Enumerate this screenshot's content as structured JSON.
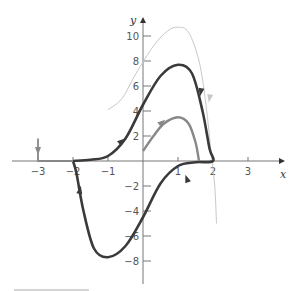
{
  "chart_data": {
    "type": "line",
    "title": "",
    "xlabel": "x",
    "ylabel": "y",
    "xlim": [
      -3.5,
      3.8
    ],
    "ylim": [
      -9.5,
      11
    ],
    "grid": false,
    "x_ticks": [
      -3,
      -2,
      -1,
      1,
      2,
      3
    ],
    "x_tick_labels": [
      "-3",
      "-2",
      "-1",
      "1",
      "2",
      "3"
    ],
    "y_ticks": [
      10,
      8,
      6,
      4,
      2,
      -2,
      -4,
      -6,
      -8
    ],
    "y_tick_labels": [
      "10",
      "8",
      "6",
      "4",
      "2",
      "-2",
      "-4",
      "-6",
      "-8"
    ],
    "series": [
      {
        "name": "light trajectory",
        "color": "#c8c8c8",
        "points": [
          [
            -1.0,
            4.1
          ],
          [
            -0.6,
            5.0
          ],
          [
            -0.2,
            7.0
          ],
          [
            0.3,
            9.2
          ],
          [
            0.7,
            10.4
          ],
          [
            1.0,
            10.7
          ],
          [
            1.3,
            10.3
          ],
          [
            1.6,
            8.0
          ],
          [
            1.8,
            4.5
          ],
          [
            1.95,
            0.5
          ],
          [
            2.05,
            -2.0
          ],
          [
            2.1,
            -5.0
          ]
        ]
      },
      {
        "name": "limit cycle",
        "color": "#3a3a3a",
        "points": [
          [
            -2.0,
            0.0
          ],
          [
            -1.5,
            0.1
          ],
          [
            -1.0,
            0.4
          ],
          [
            -0.5,
            1.8
          ],
          [
            0.0,
            4.5
          ],
          [
            0.5,
            6.8
          ],
          [
            1.0,
            7.7
          ],
          [
            1.4,
            7.0
          ],
          [
            1.7,
            4.0
          ],
          [
            1.9,
            1.0
          ],
          [
            2.0,
            0.0
          ],
          [
            1.5,
            -0.1
          ],
          [
            1.0,
            -0.4
          ],
          [
            0.5,
            -1.8
          ],
          [
            0.0,
            -4.5
          ],
          [
            -0.5,
            -6.8
          ],
          [
            -1.0,
            -7.7
          ],
          [
            -1.4,
            -7.0
          ],
          [
            -1.7,
            -4.0
          ],
          [
            -1.9,
            -1.0
          ],
          [
            -2.0,
            0.0
          ]
        ]
      },
      {
        "name": "inner trajectory",
        "color": "#888888",
        "points": [
          [
            0.0,
            0.8
          ],
          [
            0.3,
            2.0
          ],
          [
            0.6,
            3.0
          ],
          [
            1.0,
            3.5
          ],
          [
            1.3,
            3.0
          ],
          [
            1.5,
            1.5
          ],
          [
            1.6,
            0.0
          ]
        ]
      },
      {
        "name": "outer trajectory",
        "color": "#888888",
        "points": [
          [
            -3.0,
            1.8
          ],
          [
            -3.0,
            0.0
          ],
          [
            -2.0,
            0.0
          ]
        ]
      }
    ]
  },
  "axes": {
    "x_label": "x",
    "y_label": "y"
  }
}
